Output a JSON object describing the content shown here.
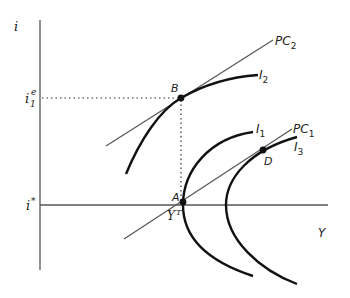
{
  "diagram": {
    "type": "economics-phillips-curve-indifference-diagram",
    "axes": {
      "y_label": "i",
      "x_label": "Y"
    },
    "y_ticks": [
      {
        "label_base": "i",
        "label_sub": "1",
        "label_sup": "e"
      },
      {
        "label_base": "i",
        "label_sup": "*"
      }
    ],
    "x_ticks": [
      {
        "label_base": "Y",
        "label_sup": "T"
      }
    ],
    "curves": [
      {
        "id": "PC2",
        "label_base": "PC",
        "label_sub": "2",
        "kind": "line"
      },
      {
        "id": "PC1",
        "label_base": "PC",
        "label_sub": "1",
        "kind": "line"
      },
      {
        "id": "I2",
        "label_base": "I",
        "label_sub": "2",
        "kind": "indifference"
      },
      {
        "id": "I1",
        "label_base": "I",
        "label_sub": "1",
        "kind": "indifference"
      },
      {
        "id": "I3",
        "label_base": "I",
        "label_sub": "3",
        "kind": "indifference"
      }
    ],
    "points": [
      {
        "id": "B",
        "label": "B"
      },
      {
        "id": "A",
        "label": "A"
      },
      {
        "id": "D",
        "label": "D"
      }
    ],
    "colors": {
      "axis": "#555555",
      "curve": "#111111",
      "line": "#555555",
      "point": "#111111"
    }
  }
}
